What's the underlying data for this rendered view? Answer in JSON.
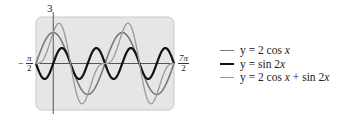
{
  "chart_data": {
    "type": "line",
    "title": "",
    "xlabel": "",
    "ylabel": "",
    "xlim": [
      -1.5708,
      10.9956
    ],
    "ylim": [
      -3,
      3
    ],
    "x_tick_labels": {
      "left": "-π/2",
      "right": "7π/2"
    },
    "y_tick_labels": {
      "top": "3",
      "bottom": "-3"
    },
    "grid": false,
    "background": "#e8e8e8",
    "legend_position": "right",
    "series": [
      {
        "name": "y = 2 cos x",
        "expr": "2*cos(x)",
        "color": "#7a7a7a",
        "width": 1.6
      },
      {
        "name": "y = sin 2x",
        "expr": "sin(2*x)",
        "color": "#111111",
        "width": 2.2
      },
      {
        "name": "y = 2 cos x + sin 2x",
        "expr": "2*cos(x)+sin(2*x)",
        "color": "#9a9a9a",
        "width": 1.3
      }
    ]
  },
  "labels": {
    "y_top": "3",
    "y_bottom": "-3",
    "x_left_sign": "−",
    "x_left_num": "π",
    "x_left_den": "2",
    "x_right_num": "7π",
    "x_right_den": "2"
  },
  "legend": {
    "items": [
      {
        "prefix": "y = 2 cos ",
        "var": "x",
        "suffix": ""
      },
      {
        "prefix": "y = sin 2",
        "var": "x",
        "suffix": ""
      },
      {
        "prefix": "y = 2 cos ",
        "var": "x",
        "suffix": " + sin 2",
        "var2": "x"
      }
    ]
  }
}
